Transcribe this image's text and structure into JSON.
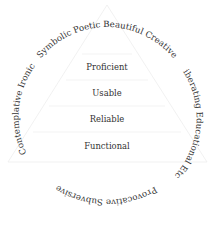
{
  "diagram": {
    "type": "pyramid-with-ring",
    "pyramid_levels": [
      {
        "label": "Proficient"
      },
      {
        "label": "Usable"
      },
      {
        "label": "Reliable"
      },
      {
        "label": "Functional"
      }
    ],
    "ring_words": {
      "top_arc": "Symbolic  Poetic  Beautiful  Creative",
      "left_arc": "Contemplative  Ironic",
      "right_arc": "Liberating  Educational  Etc.",
      "bottom_arc": "Provocative  Subversive",
      "words": [
        "Ironic",
        "Symbolic",
        "Poetic",
        "Beautiful",
        "Creative",
        "Liberating",
        "Educational",
        "Etc.",
        "Subversive",
        "Provocative",
        "Contemplative"
      ]
    },
    "colors": {
      "text": "#333333",
      "lines": "#eeeeee",
      "background": "#ffffff"
    }
  }
}
